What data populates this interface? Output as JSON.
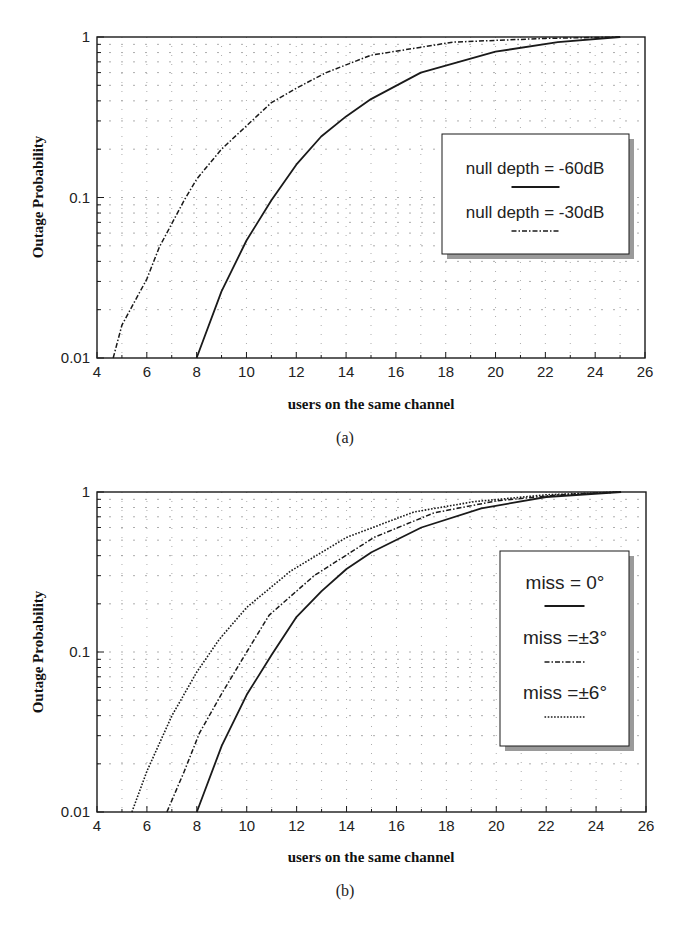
{
  "chart_data": [
    {
      "type": "line",
      "panel": "(a)",
      "caption": "(a)",
      "xlabel": "users on the same channel",
      "ylabel": "Outage Probability",
      "xlim": [
        4,
        26
      ],
      "ylim": [
        0.01,
        1
      ],
      "yscale": "log",
      "xticks": [
        4,
        6,
        8,
        10,
        12,
        14,
        16,
        18,
        20,
        22,
        24,
        26
      ],
      "yticks": [
        {
          "v": 0.01,
          "label": "0.01"
        },
        {
          "v": 0.1,
          "label": "0.1"
        },
        {
          "v": 1,
          "label": "1"
        }
      ],
      "grid": true,
      "legend_position": "right-center",
      "series": [
        {
          "name": "null depth = -60dB",
          "style": "solid",
          "x": [
            8,
            9,
            10,
            11,
            12,
            13,
            14,
            15,
            17,
            20,
            22.5,
            25
          ],
          "y": [
            0.01,
            0.026,
            0.054,
            0.096,
            0.16,
            0.24,
            0.32,
            0.41,
            0.6,
            0.81,
            0.93,
            1.0
          ]
        },
        {
          "name": "null depth = -30dB",
          "style": "dashdot",
          "x": [
            4.65,
            5,
            6,
            6.5,
            7.5,
            8,
            9,
            11,
            12,
            13.2,
            15,
            18.3,
            22,
            25
          ],
          "y": [
            0.01,
            0.016,
            0.031,
            0.049,
            0.096,
            0.13,
            0.2,
            0.39,
            0.48,
            0.6,
            0.77,
            0.93,
            0.98,
            1.0
          ]
        }
      ]
    },
    {
      "type": "line",
      "panel": "(b)",
      "caption": "(b)",
      "xlabel": "users on the same channel",
      "ylabel": "Outage Probability",
      "xlim": [
        4,
        26
      ],
      "ylim": [
        0.01,
        1
      ],
      "yscale": "log",
      "xticks": [
        4,
        6,
        8,
        10,
        12,
        14,
        16,
        18,
        20,
        22,
        24,
        26
      ],
      "yticks": [
        {
          "v": 0.01,
          "label": "0.01"
        },
        {
          "v": 0.1,
          "label": "0.1"
        },
        {
          "v": 1,
          "label": "1"
        }
      ],
      "grid": true,
      "legend_position": "right-center",
      "series": [
        {
          "name": "miss = 0°",
          "style": "solid",
          "x": [
            8,
            9,
            10,
            11,
            12,
            13,
            14,
            15,
            17,
            19.4,
            22,
            25
          ],
          "y": [
            0.01,
            0.026,
            0.054,
            0.096,
            0.166,
            0.24,
            0.33,
            0.42,
            0.6,
            0.79,
            0.93,
            1.0
          ]
        },
        {
          "name": "miss = ±3°",
          "style": "dashdot",
          "x": [
            6.8,
            7.5,
            8.1,
            9,
            10,
            10.9,
            12.7,
            15.1,
            17.5,
            20,
            22.5,
            25
          ],
          "y": [
            0.01,
            0.018,
            0.031,
            0.055,
            0.1,
            0.17,
            0.3,
            0.52,
            0.74,
            0.88,
            0.96,
            1.0
          ]
        },
        {
          "name": "miss = ±6°",
          "style": "dotted",
          "x": [
            5.4,
            6,
            7,
            8,
            8.9,
            10,
            11.75,
            14,
            16.7,
            19.1,
            22,
            25
          ],
          "y": [
            0.01,
            0.018,
            0.04,
            0.075,
            0.12,
            0.19,
            0.32,
            0.52,
            0.75,
            0.87,
            0.96,
            1.0
          ]
        }
      ]
    }
  ],
  "panels": [
    {
      "caption": "(a)",
      "xlabel": "users on the same channel",
      "ylabel": "Outage Probability",
      "legend": [
        "null depth = -60dB",
        "null depth = -30dB"
      ]
    },
    {
      "caption": "(b)",
      "xlabel": "users on the same channel",
      "ylabel": "Outage Probability",
      "legend": [
        "miss = 0°",
        "miss =±3°",
        "miss =±6°"
      ]
    }
  ],
  "colors": {
    "line": "#1a1a1a",
    "grid": "#8a8a8a",
    "shadow": "#9a9a9a",
    "background": "#ffffff"
  }
}
